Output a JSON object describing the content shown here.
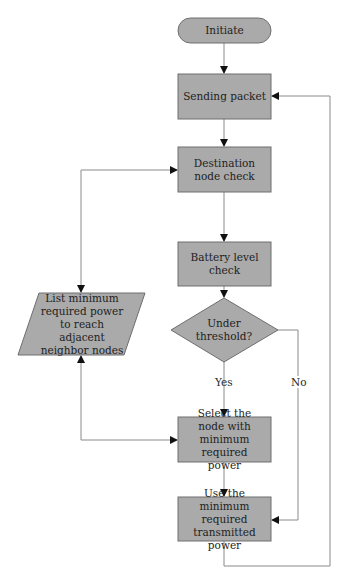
{
  "diagram": {
    "type": "flowchart",
    "colors": {
      "node_fill": "#aaaaaa",
      "node_stroke": "#6e6e6e",
      "line": "#8a8a8a",
      "arrow": "#111111",
      "text": "#1e1e1e"
    },
    "nodes": {
      "initiate": {
        "shape": "terminator",
        "label": "Initiate"
      },
      "sending_packet": {
        "shape": "process",
        "label": "Sending packet"
      },
      "destination_check": {
        "shape": "process",
        "label": "Destination node check"
      },
      "battery_check": {
        "shape": "process",
        "label": "Battery level check"
      },
      "threshold": {
        "shape": "decision",
        "label": "Under threshold?"
      },
      "list_power": {
        "shape": "data",
        "label": "List minimum required power to reach adjacent neighbor nodes"
      },
      "select_node": {
        "shape": "process",
        "label": "Select the node with minimum required power"
      },
      "use_power": {
        "shape": "process",
        "label": "Use the minimum required transmitted power"
      }
    },
    "edge_labels": {
      "yes": "Yes",
      "no": "No"
    },
    "edges": [
      {
        "from": "initiate",
        "to": "sending_packet"
      },
      {
        "from": "sending_packet",
        "to": "destination_check"
      },
      {
        "from": "destination_check",
        "to": "battery_check"
      },
      {
        "from": "destination_check",
        "to": "list_power",
        "bidirectional": true
      },
      {
        "from": "battery_check",
        "to": "threshold"
      },
      {
        "from": "threshold",
        "to": "select_node",
        "label": "Yes"
      },
      {
        "from": "threshold",
        "to": "use_power",
        "label": "No"
      },
      {
        "from": "list_power",
        "to": "select_node",
        "bidirectional": true
      },
      {
        "from": "select_node",
        "to": "use_power"
      },
      {
        "from": "use_power",
        "to": "sending_packet"
      }
    ]
  }
}
